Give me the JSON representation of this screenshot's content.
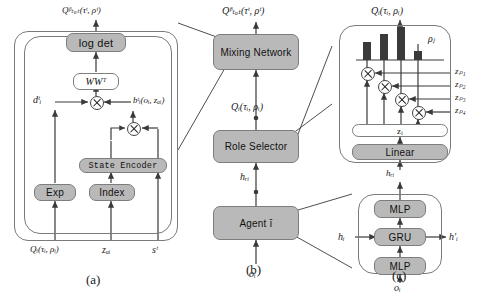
{
  "figure": {
    "caption_a": "(a)",
    "caption_b": "(b)",
    "caption_c": "(c)"
  },
  "panel_a": {
    "output_label": "Qᵝₜₒₜ(τᵗ, ρᵗ)",
    "logdet_label": "log det",
    "wwt_label": "WWᵀ",
    "d_label": "dᵗᵢ",
    "b_label": "bᵗᵢ(oᵢ, zₐᵢ)",
    "state_encoder_label": "State Encoder",
    "exp_label": "Exp",
    "index_label": "Index",
    "in_q_label": "Qᵢ(τᵢ, ρᵢ)",
    "in_za_label": "zₐᵢ",
    "in_s_label": "sᵗ"
  },
  "panel_b": {
    "output_label": "Qᵝₜₒₜ(τᵗ, ρᵗ)",
    "mixing_label": "Mixing Network",
    "q_label": "Qᵢ(τᵢ, ρᵢ)",
    "role_selector_label": "Role Selector",
    "h_tau_label": "hᵣᵢ",
    "agent_label": "Agent ī",
    "obs_label": "oᵢ"
  },
  "panel_c": {
    "output_label": "Qᵢ(τᵢ, ρᵢ)",
    "rho_label": "ρⱼ",
    "z_inputs": [
      "zₚ₁",
      "zₚ₂",
      "zₚ₃",
      "zₚ₄"
    ],
    "zi_label": "zᵢ",
    "linear_label": "Linear",
    "h_tau_label": "hᵣᵢ",
    "mlp_top_label": "MLP",
    "gru_label": "GRU",
    "mlp_bottom_label": "MLP",
    "h_in_label": "hᵢ",
    "h_out_label": "h′ᵢ",
    "obs_label": "oᵢ"
  },
  "chart_data": {
    "type": "bar",
    "categories": [
      "z_p1",
      "z_p2",
      "z_p3",
      "z_p4"
    ],
    "values": [
      0.55,
      0.78,
      1.0,
      0.28
    ],
    "xlabel": "",
    "ylabel": "",
    "ylim": [
      0,
      1.0
    ],
    "grid": false,
    "legend": "none",
    "bar_color": "#3a3a3a"
  },
  "colors": {
    "box_fill": "#b9b9b9",
    "box_light": "#ffffff",
    "outline": "#7a7a7a",
    "bar": "#3a3a3a",
    "text": "#111111"
  }
}
